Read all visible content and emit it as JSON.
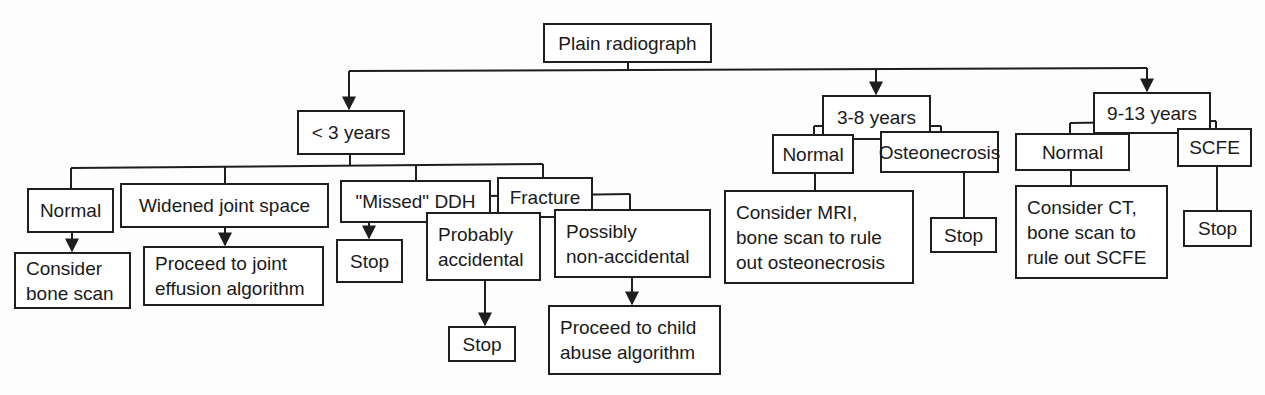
{
  "diagram": {
    "type": "flowchart",
    "root": "Plain radiograph",
    "nodes": {
      "root": "Plain radiograph",
      "age_lt3": "< 3 years",
      "age_3_8": "3-8 years",
      "age_9_13": "9-13 years",
      "lt3_normal": "Normal",
      "lt3_widened": "Widened joint space",
      "lt3_missed_ddh": "\"Missed\" DDH",
      "lt3_fracture": "Fracture",
      "lt3_normal_next": "Consider\nbone scan",
      "lt3_widened_next": "Proceed to joint\neffusion algorithm",
      "lt3_ddh_next": "Stop",
      "fracture_probably": "Probably\naccidental",
      "fracture_possibly": "Possibly\nnon-accidental",
      "probably_next": "Stop",
      "possibly_next": "Proceed to child\nabuse algorithm",
      "a38_normal": "Normal",
      "a38_osteonecrosis": "Osteonecrosis",
      "a38_normal_next": "Consider MRI,\nbone scan to rule\nout osteonecrosis",
      "a38_osteo_next": "Stop",
      "a913_normal": "Normal",
      "a913_scfe": "SCFE",
      "a913_normal_next": "Consider CT,\nbone scan to\nrule out SCFE",
      "a913_scfe_next": "Stop"
    },
    "edges": [
      [
        "root",
        "age_lt3"
      ],
      [
        "root",
        "age_3_8"
      ],
      [
        "root",
        "age_9_13"
      ],
      [
        "age_lt3",
        "lt3_normal"
      ],
      [
        "age_lt3",
        "lt3_widened"
      ],
      [
        "age_lt3",
        "lt3_missed_ddh"
      ],
      [
        "age_lt3",
        "lt3_fracture"
      ],
      [
        "lt3_normal",
        "lt3_normal_next"
      ],
      [
        "lt3_widened",
        "lt3_widened_next"
      ],
      [
        "lt3_missed_ddh",
        "lt3_ddh_next"
      ],
      [
        "lt3_fracture",
        "fracture_probably"
      ],
      [
        "lt3_fracture",
        "fracture_possibly"
      ],
      [
        "fracture_probably",
        "probably_next"
      ],
      [
        "fracture_possibly",
        "possibly_next"
      ],
      [
        "age_3_8",
        "a38_normal"
      ],
      [
        "age_3_8",
        "a38_osteonecrosis"
      ],
      [
        "a38_normal",
        "a38_normal_next"
      ],
      [
        "a38_osteonecrosis",
        "a38_osteo_next"
      ],
      [
        "age_9_13",
        "a913_normal"
      ],
      [
        "age_9_13",
        "a913_scfe"
      ],
      [
        "a913_normal",
        "a913_normal_next"
      ],
      [
        "a913_scfe",
        "a913_scfe_next"
      ]
    ],
    "colors": {
      "line": "#1e1e1e",
      "box_fill": "#ffffff",
      "background": "#fdfdfd"
    }
  }
}
